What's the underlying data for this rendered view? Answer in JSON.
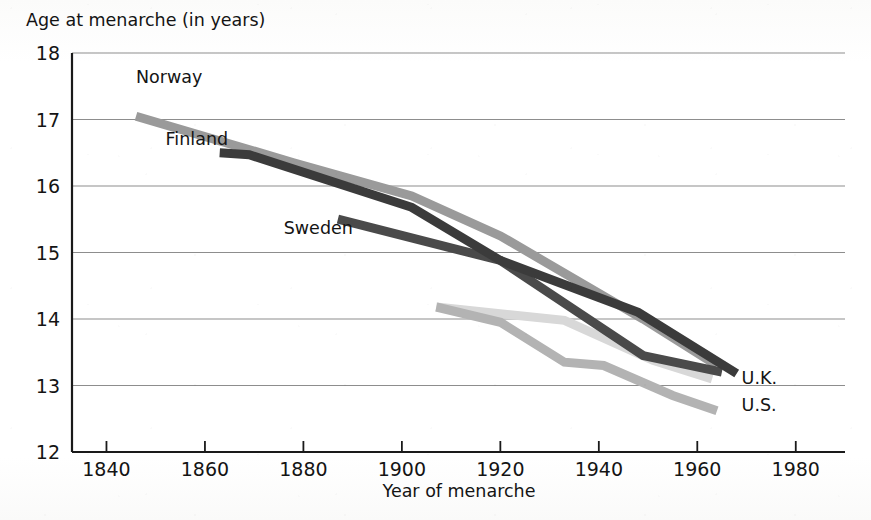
{
  "chart_data": {
    "type": "line",
    "title": "Age at menarche (in years)",
    "ylabel": "Age at menarche (in years)",
    "xlabel": "Year of menarche",
    "xlim": [
      1833,
      1990
    ],
    "ylim": [
      12,
      18
    ],
    "xticks": [
      1840,
      1860,
      1880,
      1900,
      1920,
      1940,
      1960,
      1980
    ],
    "xtick_labels": [
      "1840",
      "1860",
      "1880",
      "1900",
      "1920",
      "1940",
      "1960",
      "1980"
    ],
    "yticks": [
      12,
      13,
      14,
      15,
      16,
      17,
      18
    ],
    "ytick_labels": [
      "12",
      "13",
      "14",
      "15",
      "16",
      "17",
      "18"
    ],
    "grid": "horizontal",
    "legend": "inline-labels",
    "series": [
      {
        "name": "Norway",
        "color": "#9a9a9a",
        "label_x": 1846,
        "label_y": 17.55,
        "x": [
          1846,
          1878,
          1902,
          1920,
          1949,
          1964
        ],
        "y": [
          17.05,
          16.35,
          15.85,
          15.25,
          14.0,
          13.3
        ]
      },
      {
        "name": "Finland",
        "color": "#3b3b3b",
        "label_x": 1852,
        "label_y": 16.62,
        "x": [
          1863,
          1869,
          1902,
          1920,
          1948,
          1968
        ],
        "y": [
          16.5,
          16.47,
          15.68,
          14.88,
          14.1,
          13.18
        ]
      },
      {
        "name": "Sweden",
        "color": "#4a4a4a",
        "label_x": 1876,
        "label_y": 15.28,
        "x": [
          1887,
          1920,
          1949,
          1965
        ],
        "y": [
          15.5,
          14.88,
          13.45,
          13.2
        ]
      },
      {
        "name": "U.K.",
        "color": "#d8d8d8",
        "label_x": 1969,
        "label_y": 13.03,
        "x": [
          1907,
          1933,
          1951,
          1963
        ],
        "y": [
          14.18,
          13.98,
          13.38,
          13.1
        ]
      },
      {
        "name": "U.S.",
        "color": "#b3b3b3",
        "label_x": 1969,
        "label_y": 12.62,
        "x": [
          1907,
          1920,
          1933,
          1941,
          1955,
          1964
        ],
        "y": [
          14.18,
          13.95,
          13.35,
          13.3,
          12.85,
          12.62
        ]
      }
    ],
    "annotations": [
      {
        "text": "Norway",
        "x": 1846,
        "y": 17.55
      },
      {
        "text": "Finland",
        "x": 1852,
        "y": 16.62
      },
      {
        "text": "Sweden",
        "x": 1876,
        "y": 15.28
      },
      {
        "text": "U.K.",
        "x": 1969,
        "y": 13.03
      },
      {
        "text": "U.S.",
        "x": 1969,
        "y": 12.62
      }
    ]
  },
  "axes": {
    "y_axis_title": "Age at menarche (in years)",
    "x_axis_title": "Year of menarche"
  }
}
